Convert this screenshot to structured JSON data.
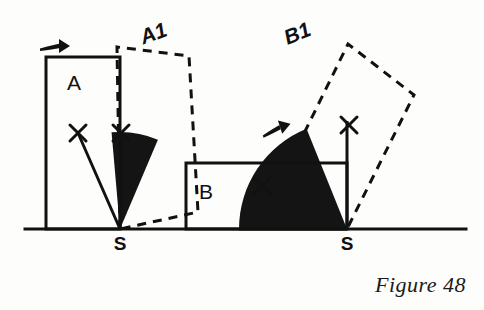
{
  "figure": {
    "caption": "Figure 48",
    "ground_line": {
      "x1": 25,
      "y1": 229,
      "x2": 466,
      "y2": 229,
      "width": 3
    },
    "colors": {
      "ink": "#111111",
      "paper": "#fdfdfb",
      "sector_fill": "#141414",
      "solid_stroke": "#111111",
      "dashed_stroke": "#111111"
    },
    "pivots": [
      {
        "name": "S-left",
        "label": "S",
        "x": 120,
        "y": 229,
        "label_x": 120,
        "label_y": 250
      },
      {
        "name": "S-right",
        "label": "S",
        "x": 347,
        "y": 229,
        "label_x": 347,
        "label_y": 250
      }
    ],
    "left": {
      "name": "rotation-A",
      "original": {
        "label": "A",
        "label_x": 74,
        "label_y": 90,
        "points": "46,57 120,57 120,229 46,229"
      },
      "image": {
        "label": "A1",
        "label_x": 156,
        "label_y": 40,
        "points": "120,229 117,47 189,56 198,212",
        "dash": "9,7",
        "stroke_width": 3
      },
      "sector": {
        "center_x": 120,
        "center_y": 229,
        "radius": 97,
        "start_angle_deg": 265,
        "end_angle_deg": 293,
        "fill": "#141414"
      },
      "radii": [
        {
          "x1": 120,
          "y1": 229,
          "x2": 78,
          "y2": 133
        },
        {
          "x1": 120,
          "y1": 229,
          "x2": 121,
          "y2": 133
        }
      ],
      "cross_marks": [
        {
          "x": 78,
          "y": 133,
          "size": 8
        },
        {
          "x": 121,
          "y": 133,
          "size": 8
        }
      ],
      "arrow": {
        "x": 40,
        "y": 46,
        "length": 30,
        "angle_deg": 0,
        "dir": "right"
      }
    },
    "right": {
      "name": "rotation-B",
      "original": {
        "label": "B",
        "label_x": 206,
        "label_y": 199,
        "points": "186,163 347,163 347,229 186,229"
      },
      "image": {
        "label": "B1",
        "label_x": 300,
        "label_y": 40,
        "points": "347,229 285,172 348,44 414,95",
        "dash": "9,7",
        "stroke_width": 3
      },
      "sector": {
        "center_x": 347,
        "center_y": 229,
        "radius": 108,
        "start_angle_deg": 180,
        "end_angle_deg": 248,
        "fill": "#141414"
      },
      "radii": [
        {
          "x1": 347,
          "y1": 229,
          "x2": 239,
          "y2": 229
        },
        {
          "x1": 347,
          "y1": 229,
          "x2": 347,
          "y2": 121
        }
      ],
      "cross_marks": [
        {
          "x": 262,
          "y": 186,
          "size": 8
        },
        {
          "x": 349,
          "y": 125,
          "size": 8
        }
      ],
      "arrow": {
        "x": 262,
        "y": 133,
        "length": 30,
        "angle_deg": -18,
        "dir": "right"
      }
    }
  }
}
